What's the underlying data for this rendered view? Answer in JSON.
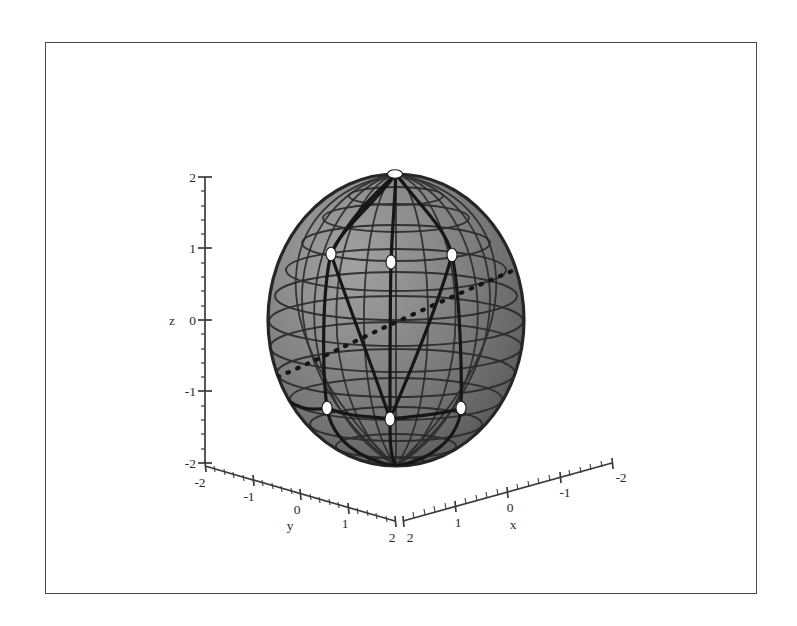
{
  "figure": {
    "title": "",
    "background_color": "#ffffff",
    "frame_color": "#4a4a4a",
    "frame": {
      "x": 45,
      "y": 42,
      "width": 712,
      "height": 552
    }
  },
  "chart_data": {
    "type": "scatter",
    "render": "3d-sphere-plot",
    "title": "",
    "xlabel": "x",
    "ylabel": "y",
    "zlabel": "z",
    "xlim": [
      -2,
      2
    ],
    "ylim": [
      -2,
      2
    ],
    "zlim": [
      -2,
      2
    ],
    "grid": false,
    "legend": null,
    "axes": {
      "z": {
        "label": "z",
        "label_pos": 0,
        "ticks": [
          2,
          1,
          0,
          -1,
          -2
        ],
        "tick_labels": [
          "2",
          "1",
          "0",
          "-1",
          "-2"
        ],
        "minor_tick_step": 0.2,
        "direction": "vertical-up"
      },
      "y": {
        "label": "y",
        "label_pos": 0,
        "ticks": [
          -2,
          -1,
          0,
          1,
          2
        ],
        "tick_labels": [
          "-2",
          "-1",
          "0",
          "1",
          "2"
        ],
        "minor_tick_step": 0.2,
        "direction": "down-right-to-front-corner"
      },
      "x": {
        "label": "x",
        "label_pos": 0,
        "ticks": [
          2,
          1,
          0,
          -1,
          -2
        ],
        "tick_labels": [
          "2",
          "1",
          "0",
          "-1",
          "-2"
        ],
        "minor_tick_step": 0.2,
        "direction": "up-right-from-front-corner"
      }
    },
    "surface": {
      "name": "unit-sphere",
      "shape": "sphere",
      "center": [
        0,
        0,
        0
      ],
      "radius": 1,
      "fill_light": "#8f8f8f",
      "fill_dark": "#4c4c4c",
      "mesh_color": "#2e2e2e",
      "mesh_parallels": 11,
      "mesh_meridians": 16
    },
    "curves": [
      {
        "name": "geodesic-arc-1",
        "style": "solid",
        "color": "#171717",
        "width": 3.0
      },
      {
        "name": "geodesic-arc-2",
        "style": "solid",
        "color": "#171717",
        "width": 3.0
      },
      {
        "name": "geodesic-arc-3",
        "style": "solid",
        "color": "#171717",
        "width": 3.0
      },
      {
        "name": "geodesic-arc-4",
        "style": "solid",
        "color": "#171717",
        "width": 3.0
      },
      {
        "name": "geodesic-arc-5",
        "style": "solid",
        "color": "#171717",
        "width": 3.0
      },
      {
        "name": "geodesic-arc-6",
        "style": "solid",
        "color": "#171717",
        "width": 3.0
      },
      {
        "name": "dotted-great-circle",
        "style": "dotted",
        "color": "#171717",
        "width": 3.4
      }
    ],
    "markers": {
      "name": "white-vertex-points",
      "style": "filled-circle",
      "face_color": "#ffffff",
      "edge_color": "#1a1a1a",
      "count": 7,
      "points_px": [
        {
          "cx": 395,
          "cy": 174,
          "rx": 7.5,
          "ry": 4.2,
          "label": "north-pole"
        },
        {
          "cx": 331,
          "cy": 254,
          "rx": 5.0,
          "ry": 6.8,
          "label": "upper-left"
        },
        {
          "cx": 391,
          "cy": 262,
          "rx": 5.0,
          "ry": 7.0,
          "label": "upper-center"
        },
        {
          "cx": 452,
          "cy": 255,
          "rx": 5.0,
          "ry": 6.8,
          "label": "upper-right"
        },
        {
          "cx": 327,
          "cy": 408,
          "rx": 5.0,
          "ry": 6.8,
          "label": "lower-left"
        },
        {
          "cx": 390,
          "cy": 419,
          "rx": 5.0,
          "ry": 7.0,
          "label": "lower-center"
        },
        {
          "cx": 461,
          "cy": 408,
          "rx": 5.0,
          "ry": 6.8,
          "label": "lower-right"
        }
      ]
    }
  }
}
